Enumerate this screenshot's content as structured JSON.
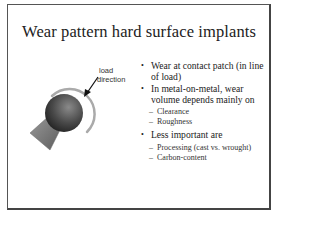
{
  "slide": {
    "title": "Wear pattern hard surface implants",
    "figure": {
      "label_line1": "load",
      "label_line2": "direction",
      "icon": "ball-and-socket-implant-diagram"
    },
    "bullets": [
      {
        "text": "Wear at contact patch (in line of load)",
        "sub": []
      },
      {
        "text": "In metal-on-metal, wear volume depends mainly on",
        "sub": [
          "Clearance",
          "Roughness"
        ]
      },
      {
        "text": "Less important are",
        "sub": [
          "Processing (cast vs. wrought)",
          "Carbon-content"
        ]
      }
    ],
    "colors": {
      "border": "#555555",
      "text": "#222222",
      "arc": "#a8a8a8",
      "sphere_dark": "#2a2a2a",
      "sphere_light": "#8a8a8a",
      "cone": "#777777"
    }
  }
}
